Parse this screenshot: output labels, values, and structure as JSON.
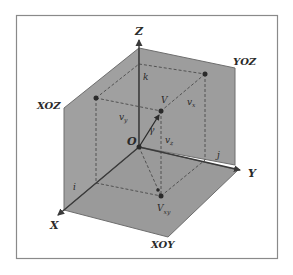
{
  "figure": {
    "type": "3d-coordinate-system",
    "colors": {
      "background": "#ffffff",
      "frame": "#8a8a8a",
      "plane_fill": "#9c9c9c",
      "plane_edge": "#6e6e6e",
      "axis": "#3a3a3a",
      "dashed": "#4a4a4a",
      "point": "#2a2a2a"
    },
    "planes": {
      "xoz": "XOZ",
      "yoz": "YOZ",
      "xoy": "XOY"
    },
    "axes": {
      "x": "X",
      "y": "Y",
      "z": "Z",
      "origin": "O"
    },
    "unit_vectors": {
      "i": "i",
      "j": "j",
      "k": "k"
    },
    "vector": {
      "name": "V",
      "angle": "γ",
      "projection_xy": {
        "base": "V",
        "sub": "xy"
      },
      "components": {
        "v_x": {
          "base": "v",
          "sub": "x"
        },
        "v_y": {
          "base": "v",
          "sub": "y"
        },
        "v_z": {
          "base": "v",
          "sub": "z"
        }
      }
    }
  }
}
